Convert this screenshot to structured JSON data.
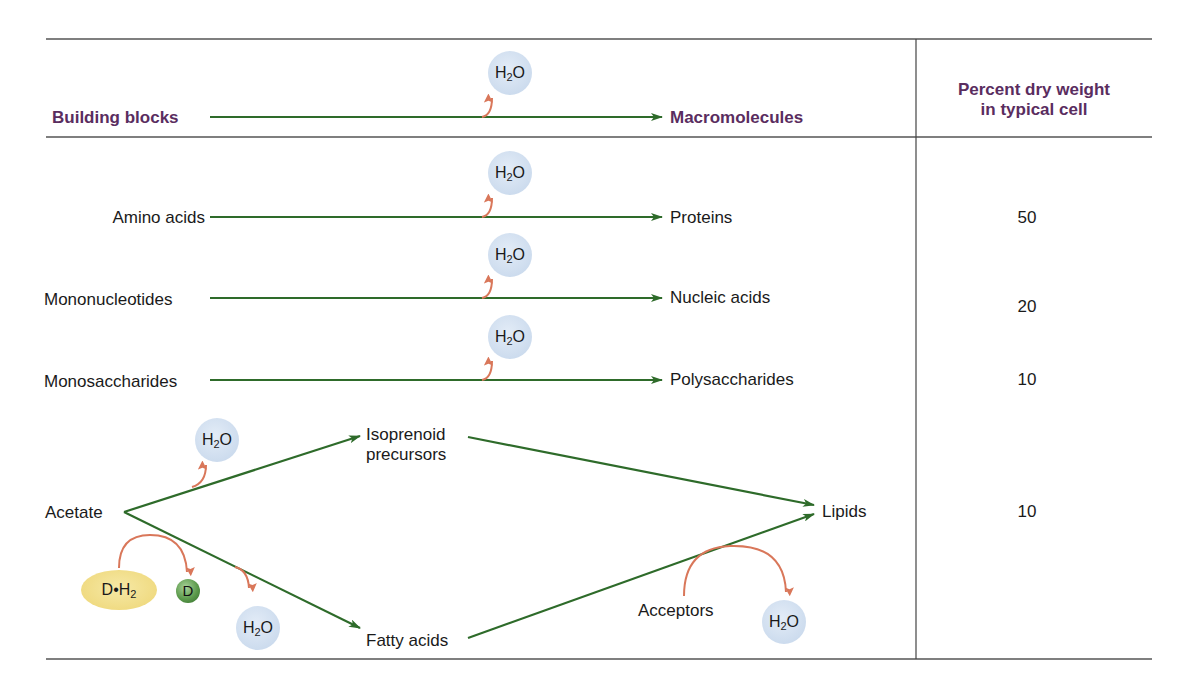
{
  "header": {
    "building_blocks": "Building blocks",
    "macromolecules": "Macromolecules",
    "percent_line1": "Percent dry weight",
    "percent_line2": "in typical cell",
    "water": "H",
    "water_sub": "2",
    "water_tail": "O"
  },
  "rows": [
    {
      "block": "Amino acids",
      "macro": "Proteins",
      "percent": "50"
    },
    {
      "block": "Mononucleotides",
      "macro": "Nucleic acids",
      "percent": "20"
    },
    {
      "block": "Monosaccharides",
      "macro": "Polysaccharides",
      "percent": "10"
    }
  ],
  "lipid_pathway": {
    "source": "Acetate",
    "intermediate_upper_line1": "Isoprenoid",
    "intermediate_upper_line2": "precursors",
    "intermediate_lower": "Fatty acids",
    "product": "Lipids",
    "percent": "10",
    "donor_reduced": "D•H",
    "donor_reduced_sub": "2",
    "donor_oxidized": "D",
    "acceptors": "Acceptors"
  },
  "colors": {
    "header_text": "#5a2d5f",
    "reaction_arrow": "#2e6b2a",
    "side_arrow": "#d9775a",
    "water_bubble": "#cddcee",
    "donor_bubble": "#efd97e",
    "rule": "#555555"
  }
}
